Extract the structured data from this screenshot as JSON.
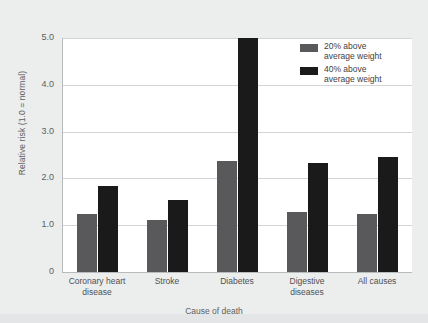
{
  "chart_data": {
    "type": "bar",
    "title": "",
    "xlabel": "Cause of death",
    "ylabel": "Relative risk (1.0 = normal)",
    "categories": [
      "Coronary heart disease",
      "Stroke",
      "Diabetes",
      "Digestive diseases",
      "All causes"
    ],
    "series": [
      {
        "name": "20% above average weight",
        "color": "#59595b",
        "values": [
          1.25,
          1.11,
          2.38,
          1.29,
          1.24
        ]
      },
      {
        "name": "40% above average weight",
        "color": "#1a1a1a",
        "values": [
          1.83,
          1.53,
          5.0,
          2.33,
          2.45
        ]
      }
    ],
    "ylim": [
      0,
      5.0
    ],
    "yticks": [
      "0",
      "1.0",
      "2.0",
      "3.0",
      "4.0",
      "5.0"
    ],
    "ytick_values": [
      0,
      1.0,
      2.0,
      3.0,
      4.0,
      5.0
    ],
    "grid": true,
    "legend_position": "top-right"
  },
  "legend": {
    "items": [
      {
        "label": "20% above\naverage weight",
        "color": "#59595b"
      },
      {
        "label": "40% above\naverage weight",
        "color": "#1a1a1a"
      }
    ]
  },
  "axes": {
    "y_title": "Relative risk (1.0 = normal)",
    "x_title": "Cause of death"
  },
  "colors": {
    "background": "#eceded",
    "plot_background": "#ffffff",
    "gridline": "#d3d4d6",
    "series_20": "#59595b",
    "series_40": "#1a1a1a",
    "text": "#5d5f61"
  }
}
